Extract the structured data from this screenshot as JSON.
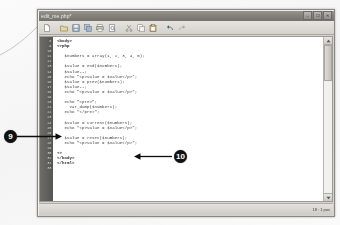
{
  "window": {
    "title": "edit_me.php*",
    "controls": [
      {
        "name": "minimize",
        "glyph": "–"
      },
      {
        "name": "maximize",
        "glyph": "❐"
      },
      {
        "name": "close",
        "glyph": "✕"
      }
    ]
  },
  "toolbar": {
    "buttons": [
      {
        "name": "new-file",
        "icon": "new-file-icon"
      },
      {
        "name": "open-file",
        "icon": "open-folder-icon"
      },
      {
        "name": "save",
        "icon": "save-disk-icon"
      },
      {
        "name": "save-all",
        "icon": "save-all-icon"
      },
      {
        "name": "print",
        "icon": "print-icon"
      },
      {
        "name": "print-preview",
        "icon": "print-preview-icon"
      },
      {
        "name": "cut",
        "icon": "scissors-icon"
      },
      {
        "name": "copy",
        "icon": "copy-icon"
      },
      {
        "name": "paste",
        "icon": "clipboard-icon"
      },
      {
        "name": "undo",
        "icon": "undo-arrow-icon"
      },
      {
        "name": "redo",
        "icon": "redo-arrow-icon"
      }
    ]
  },
  "editor": {
    "first_line_number": 8,
    "lines": [
      {
        "no": "8",
        "text": "<body>",
        "style": "tag"
      },
      {
        "no": "9",
        "text": "<?php",
        "style": "kw"
      },
      {
        "no": "10",
        "text": "",
        "style": "blank"
      },
      {
        "no": "11",
        "text": "   $numbers = array(1, 2, 3, 4, 5);",
        "style": ""
      },
      {
        "no": "12",
        "text": "",
        "style": "blank"
      },
      {
        "no": "13",
        "text": "   $value = end($numbers);",
        "style": ""
      },
      {
        "no": "14",
        "text": "   $value--;",
        "style": ""
      },
      {
        "no": "15",
        "text": "   echo \"<p>Value = $value</p>\";",
        "style": ""
      },
      {
        "no": "16",
        "text": "   $value = prev($numbers);",
        "style": ""
      },
      {
        "no": "17",
        "text": "   $value--;",
        "style": ""
      },
      {
        "no": "18",
        "text": "   echo \"<p>Value = $value</p>\";",
        "style": ""
      },
      {
        "no": "19",
        "text": "",
        "style": "blank"
      },
      {
        "no": "20",
        "text": "   echo \"<pre>\";",
        "style": ""
      },
      {
        "no": "21",
        "text": "     var_dump($numbers);",
        "style": ""
      },
      {
        "no": "22",
        "text": "   echo \"</pre>\";",
        "style": ""
      },
      {
        "no": "23",
        "text": "",
        "style": "blank"
      },
      {
        "no": "24",
        "text": "   $value = current($numbers);",
        "style": ""
      },
      {
        "no": "25",
        "text": "   echo \"<p>Value = $value</p>\";",
        "style": ""
      },
      {
        "no": "26",
        "text": "",
        "style": "blank"
      },
      {
        "no": "27",
        "text": "   $value = reset($numbers);",
        "style": ""
      },
      {
        "no": "28",
        "text": "   echo \"<p>Value = $value</p>\";",
        "style": ""
      },
      {
        "no": "29",
        "text": "",
        "style": "blank"
      },
      {
        "no": "30",
        "text": "?>",
        "style": "kw"
      },
      {
        "no": "31",
        "text": "</body>",
        "style": "tag"
      },
      {
        "no": "32",
        "text": "</html>",
        "style": "tag"
      },
      {
        "no": "33",
        "text": "",
        "style": "blank"
      }
    ]
  },
  "statusbar": {
    "text": "18 : 1 pos"
  },
  "callouts": [
    {
      "id": "9",
      "label": "9",
      "points_to": "current-line",
      "arrow": "right"
    },
    {
      "id": "10",
      "label": "10",
      "points_to": "reset-line",
      "arrow": "left"
    }
  ],
  "colors": {
    "titlebar": "#86847d",
    "chrome": "#d6d3ce",
    "gutter": "#5e5c58",
    "editor_bg": "#ffffff",
    "callout_bg": "#111111",
    "callout_fg": "#ffffff"
  }
}
